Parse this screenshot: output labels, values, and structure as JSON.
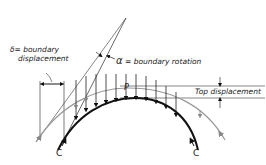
{
  "diagram": {
    "type": "arch boundary displacement diagram",
    "labels": {
      "delta_symbol": "δ",
      "delta_eq": "= boundary",
      "delta_line2": "displacement",
      "alpha_symbol": "α",
      "alpha_text": " = boundary rotation",
      "top_displacement": "Top displacement",
      "point_p": "P",
      "crown_left": "C",
      "crown_right": "C"
    },
    "colors": {
      "arch": "#111111",
      "deformed_arch": "#9a9a9a",
      "lines": "#444444",
      "text": "#222222"
    },
    "load_arrows_x": [
      76,
      86,
      96,
      106,
      116,
      126,
      136,
      146,
      156,
      166,
      176
    ]
  }
}
